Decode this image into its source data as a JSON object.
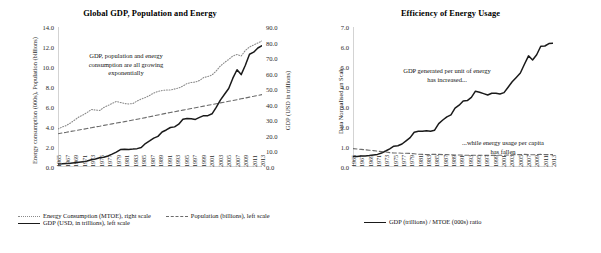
{
  "figure": {
    "background": "#ffffff",
    "colors": {
      "gdp_line": "#1a1a1a",
      "population_line": "#6b6b6b",
      "energy_line": "#8a8a8a",
      "axis": "#d3d3d3",
      "text": "#1a1a1a"
    }
  },
  "left_panel": {
    "title": "Global GDP, Population and Energy",
    "annotation": "GDP, population and energy consumption are all growing exponentially",
    "y_left_label": "Energy consumption (000s), Population (billions)",
    "y_right_label": "GDP (USD in trillions)",
    "y_left_ticks": [
      "0.0",
      "2.0",
      "4.0",
      "6.0",
      "8.0",
      "10.0",
      "12.0",
      "14.0"
    ],
    "y_right_ticks": [
      "0.0",
      "10.0",
      "20.0",
      "30.0",
      "40.0",
      "50.0",
      "60.0",
      "70.0",
      "80.0",
      "90.0"
    ],
    "legend": [
      {
        "label": "Energy Consumption (MTOE), right scale",
        "style": "dotted"
      },
      {
        "label": "Population (billions), left scale",
        "style": "dashed"
      },
      {
        "label": "GDP (USD, in trillions), left scale",
        "style": "solid"
      }
    ]
  },
  "right_panel": {
    "title": "Efficiency of Energy Usage",
    "annotation_top": "GDP generated per unit of energy has increased...",
    "annotation_bottom": "...while energy usage per capita has fallen",
    "y_label": "Data Normalised on Scale",
    "y_ticks": [
      "0.0",
      "1.0",
      "2.0",
      "3.0",
      "4.0",
      "5.0",
      "6.0",
      "7.0"
    ],
    "legend": [
      {
        "label": "GDP (trillions) / MTOE (000s) ratio",
        "style": "solid"
      }
    ]
  },
  "chart_data": [
    {
      "id": "global-gdp-population-energy",
      "type": "line",
      "title": "Global GDP, Population and Energy",
      "xlabel": "",
      "ylabel": "Energy consumption (000s), Population (billions)",
      "y2label": "GDP (USD in trillions)",
      "ylim": [
        0.0,
        14.0
      ],
      "y2lim": [
        0.0,
        90.0
      ],
      "ytick_step": 2.0,
      "y2tick_step": 10.0,
      "grid": false,
      "legend_position": "bottom",
      "x": [
        1965,
        1966,
        1967,
        1968,
        1969,
        1970,
        1971,
        1972,
        1973,
        1974,
        1975,
        1976,
        1977,
        1978,
        1979,
        1980,
        1981,
        1982,
        1983,
        1984,
        1985,
        1986,
        1987,
        1988,
        1989,
        1990,
        1991,
        1992,
        1993,
        1994,
        1995,
        1996,
        1997,
        1998,
        1999,
        2000,
        2001,
        2002,
        2003,
        2004,
        2005,
        2006,
        2007,
        2008,
        2009,
        2010,
        2011,
        2012,
        2013,
        2014
      ],
      "xtick_labels": [
        "1965",
        "1967",
        "1969",
        "1971",
        "1973",
        "1975",
        "1977",
        "1979",
        "1981",
        "1983",
        "1985",
        "1987",
        "1989",
        "1991",
        "1993",
        "1995",
        "1997",
        "1999",
        "2001",
        "2003",
        "2005",
        "2007",
        "2009",
        "2011",
        "2013"
      ],
      "series": [
        {
          "name": "Energy Consumption (MTOE), right scale",
          "axis": "right",
          "style": "dotted",
          "color": "#8a8a8a",
          "units": "MTOE",
          "values": [
            3800,
            4000,
            4150,
            4400,
            4700,
            5000,
            5200,
            5450,
            5750,
            5700,
            5650,
            5950,
            6150,
            6350,
            6550,
            6450,
            6350,
            6300,
            6350,
            6600,
            6800,
            6950,
            7150,
            7400,
            7550,
            7650,
            7700,
            7700,
            7800,
            7900,
            8100,
            8350,
            8450,
            8500,
            8650,
            8950,
            9050,
            9200,
            9600,
            10100,
            10450,
            10750,
            11100,
            11250,
            11100,
            11650,
            12000,
            12200,
            12400,
            12600
          ]
        },
        {
          "name": "Population (billions), left scale",
          "axis": "left",
          "style": "dashed",
          "color": "#6b6b6b",
          "units": "billions",
          "values": [
            3.33,
            3.4,
            3.47,
            3.55,
            3.62,
            3.7,
            3.77,
            3.85,
            3.93,
            4.01,
            4.08,
            4.16,
            4.23,
            4.31,
            4.39,
            4.46,
            4.54,
            4.62,
            4.7,
            4.78,
            4.86,
            4.94,
            5.03,
            5.11,
            5.2,
            5.29,
            5.37,
            5.45,
            5.53,
            5.61,
            5.69,
            5.77,
            5.85,
            5.93,
            6.01,
            6.09,
            6.17,
            6.25,
            6.33,
            6.41,
            6.49,
            6.57,
            6.65,
            6.73,
            6.82,
            6.9,
            6.99,
            7.07,
            7.16,
            7.24
          ]
        },
        {
          "name": "GDP (USD, in trillions), left scale",
          "axis": "right",
          "style": "solid",
          "color": "#1a1a1a",
          "units": "USD trillions",
          "values": [
            2.0,
            2.1,
            2.3,
            2.4,
            2.7,
            3.0,
            3.3,
            3.8,
            4.6,
            5.2,
            5.9,
            6.3,
            7.1,
            8.3,
            9.6,
            11.2,
            11.4,
            11.3,
            11.5,
            11.8,
            12.5,
            15.1,
            16.8,
            18.6,
            19.7,
            22.5,
            23.8,
            25.4,
            25.8,
            27.5,
            30.7,
            31.2,
            31.0,
            30.6,
            31.9,
            33.0,
            33.0,
            34.2,
            38.3,
            43.0,
            46.8,
            50.5,
            57.1,
            62.5,
            59.4,
            65.4,
            72.5,
            73.8,
            76.5,
            78.0
          ]
        }
      ],
      "annotations": [
        {
          "text": "GDP, population and energy consumption are all growing exponentially",
          "x": 1977,
          "y": 10.6
        }
      ]
    },
    {
      "id": "efficiency-of-energy-usage",
      "type": "line",
      "title": "Efficiency of Energy Usage",
      "xlabel": "",
      "ylabel": "Data Normalised on Scale",
      "ylim": [
        0.0,
        7.0
      ],
      "ytick_step": 1.0,
      "grid": false,
      "legend_position": "bottom",
      "x": [
        1965,
        1966,
        1967,
        1968,
        1969,
        1970,
        1971,
        1972,
        1973,
        1974,
        1975,
        1976,
        1977,
        1978,
        1979,
        1980,
        1981,
        1982,
        1983,
        1984,
        1985,
        1986,
        1987,
        1988,
        1989,
        1990,
        1991,
        1992,
        1993,
        1994,
        1995,
        1996,
        1997,
        1998,
        1999,
        2000,
        2001,
        2002,
        2003,
        2004,
        2005,
        2006,
        2007,
        2008,
        2009,
        2010,
        2011,
        2012,
        2013,
        2014
      ],
      "xtick_labels": [
        "1965",
        "1967",
        "1969",
        "1971",
        "1973",
        "1975",
        "1977",
        "1979",
        "1981",
        "1983",
        "1985",
        "1987",
        "1989",
        "1991",
        "1993",
        "1995",
        "1997",
        "1999",
        "2001",
        "2003",
        "2005",
        "2007",
        "2009",
        "2011",
        "2013"
      ],
      "series": [
        {
          "name": "GDP (trillions) / MTOE (000s) ratio",
          "style": "solid",
          "color": "#1a1a1a",
          "values": [
            0.53,
            0.53,
            0.55,
            0.55,
            0.57,
            0.6,
            0.63,
            0.7,
            0.8,
            0.91,
            1.04,
            1.06,
            1.15,
            1.31,
            1.47,
            1.74,
            1.79,
            1.79,
            1.81,
            1.79,
            1.84,
            2.17,
            2.35,
            2.51,
            2.61,
            2.94,
            3.09,
            3.3,
            3.32,
            3.48,
            3.79,
            3.74,
            3.67,
            3.6,
            3.69,
            3.69,
            3.65,
            3.72,
            3.99,
            4.26,
            4.48,
            4.7,
            5.14,
            5.56,
            5.35,
            5.61,
            6.04,
            6.05,
            6.17,
            6.19
          ]
        },
        {
          "name": "energy usage per capita",
          "style": "dashed",
          "color": "#6b6b6b",
          "values": [
            0.92,
            0.9,
            0.88,
            0.86,
            0.84,
            0.82,
            0.79,
            0.77,
            0.75,
            0.72,
            0.7,
            0.7,
            0.69,
            0.69,
            0.68,
            0.66,
            0.64,
            0.63,
            0.62,
            0.63,
            0.63,
            0.63,
            0.62,
            0.62,
            0.61,
            0.6,
            0.6,
            0.59,
            0.59,
            0.59,
            0.59,
            0.59,
            0.59,
            0.58,
            0.58,
            0.59,
            0.59,
            0.59,
            0.6,
            0.61,
            0.62,
            0.62,
            0.63,
            0.62,
            0.61,
            0.62,
            0.63,
            0.62,
            0.62,
            0.62
          ]
        }
      ],
      "annotations": [
        {
          "text": "GDP generated per unit of energy has increased...",
          "x": 1981,
          "y": 4.6
        },
        {
          "text": "...while energy usage per capita has fallen",
          "x": 2004,
          "y": 1.55
        }
      ]
    }
  ]
}
